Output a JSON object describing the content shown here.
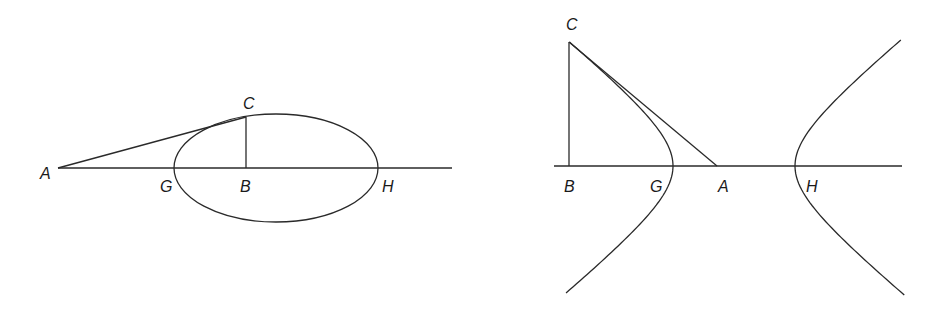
{
  "figures": [
    {
      "id": "ellipse",
      "curve": "ellipse",
      "labels": {
        "A": "A",
        "B": "B",
        "C": "C",
        "G": "G",
        "H": "H"
      },
      "points": {
        "A": [
          58,
          168
        ],
        "B": [
          246,
          168
        ],
        "C": [
          246,
          117
        ],
        "G": [
          174,
          168
        ],
        "H": [
          378,
          168
        ]
      },
      "ellipse": {
        "cx": 276,
        "cy": 168,
        "rx": 102,
        "ry": 54
      },
      "axis": {
        "x1": 58,
        "x2": 452,
        "y": 168
      }
    },
    {
      "id": "hyperbola",
      "curve": "hyperbola",
      "labels": {
        "A": "A",
        "B": "B",
        "C": "C",
        "G": "G",
        "H": "H"
      },
      "points": {
        "A": [
          717,
          166
        ],
        "B": [
          569,
          166
        ],
        "C": [
          569,
          42
        ],
        "G": [
          673,
          166
        ],
        "H": [
          795,
          166
        ]
      },
      "hyperbola": {
        "cx": 734,
        "cy": 166,
        "a": 61,
        "b": 49.5
      },
      "axis": {
        "x1": 554,
        "x2": 902,
        "y": 166
      }
    }
  ],
  "colors": {
    "line": "#2a2a2a",
    "background": "#ffffff"
  }
}
